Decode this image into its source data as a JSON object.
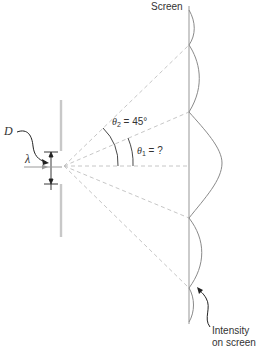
{
  "labels": {
    "screen": "Screen",
    "D": "D",
    "lambda": "λ",
    "theta2_symbol": "θ",
    "theta2_sub": "2",
    "theta2_value": " = 45°",
    "theta1_symbol": "θ",
    "theta1_sub": "1",
    "theta1_value": " = ?",
    "intensity_line1": "Intensity",
    "intensity_line2": "on screen"
  },
  "colors": {
    "barrier": "#c8c8c8",
    "screen_line": "#a8a8a8",
    "dashed": "#c0c0c0",
    "curve": "#8a8a8a",
    "ink": "#222222"
  },
  "geometry": {
    "slit_center": [
      64,
      163
    ],
    "screen_x": 189,
    "minima_y": [
      45,
      112,
      218,
      288
    ],
    "central_peak_y": 163
  }
}
